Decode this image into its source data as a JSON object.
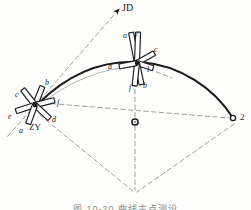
{
  "figure": {
    "title_label": "JD",
    "caption": "图 10-20  曲线主点测设",
    "vertex_point_label": "2",
    "station_label": "ZY",
    "center_mark_name": "circle-center-mark",
    "colors": {
      "ink": "#1a1a1a",
      "dashed": "#8d8d8d",
      "paper": "#fdfdfb",
      "caption": "#8e8e8e"
    },
    "curve": {
      "type": "circular-transition-curve",
      "start_xy": [
        38,
        104
      ],
      "end_xy": [
        233,
        118
      ],
      "apex_xy": [
        140,
        62
      ]
    },
    "markers": [
      {
        "name": "zy-station-marker",
        "center_xy": [
          35,
          105
        ],
        "style": "six-spoke-star",
        "label": "ZY",
        "spoke_labels": [
          "a",
          "b",
          "c",
          "d",
          "e",
          "f"
        ]
      },
      {
        "name": "curve-point-marker",
        "center_xy": [
          137,
          63
        ],
        "style": "six-spoke-star",
        "spoke_labels": [
          "a",
          "b",
          "c",
          "d",
          "e",
          "f",
          "l"
        ]
      }
    ],
    "point_labels": [
      {
        "id": "jd",
        "text": "JD",
        "x": 122,
        "y": 3,
        "size": 10,
        "italic": false
      },
      {
        "id": "u-a",
        "text": "a",
        "x": 123,
        "y": 32,
        "size": 8,
        "italic": true
      },
      {
        "id": "u-e",
        "text": "e",
        "x": 135,
        "y": 30,
        "size": 8,
        "italic": true
      },
      {
        "id": "u-c",
        "text": "c",
        "x": 154,
        "y": 46,
        "size": 8,
        "italic": true
      },
      {
        "id": "u-l",
        "text": "l",
        "x": 147,
        "y": 66,
        "size": 8,
        "italic": true
      },
      {
        "id": "u-d",
        "text": "d",
        "x": 108,
        "y": 63,
        "size": 8,
        "italic": true
      },
      {
        "id": "u-b",
        "text": "b",
        "x": 143,
        "y": 82,
        "size": 8,
        "italic": true
      },
      {
        "id": "u-f",
        "text": "f",
        "x": 129,
        "y": 84,
        "size": 8,
        "italic": true
      },
      {
        "id": "z-b",
        "text": "b",
        "x": 45,
        "y": 79,
        "size": 8,
        "italic": true
      },
      {
        "id": "z-c",
        "text": "c",
        "x": 15,
        "y": 91,
        "size": 8,
        "italic": true
      },
      {
        "id": "z-f",
        "text": "f",
        "x": 57,
        "y": 99,
        "size": 8,
        "italic": true
      },
      {
        "id": "z-e",
        "text": "e",
        "x": 8,
        "y": 113,
        "size": 8,
        "italic": true
      },
      {
        "id": "z-d",
        "text": "d",
        "x": 52,
        "y": 116,
        "size": 8,
        "italic": true
      },
      {
        "id": "z-a",
        "text": "a",
        "x": 19,
        "y": 127,
        "size": 8,
        "italic": true
      },
      {
        "id": "zy-text",
        "text": "ZY",
        "x": 29,
        "y": 123,
        "size": 9,
        "italic": false
      },
      {
        "id": "pt-2",
        "text": "2",
        "x": 240,
        "y": 113,
        "size": 9,
        "italic": false
      }
    ]
  }
}
